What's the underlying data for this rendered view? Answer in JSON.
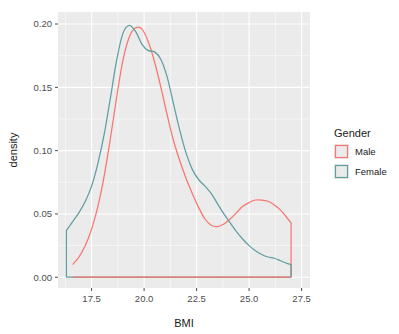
{
  "chart_data": {
    "type": "line",
    "title": "",
    "subtitle": "",
    "xlabel": "BMI",
    "ylabel": "density",
    "xlim": [
      15.9,
      27.9
    ],
    "ylim": [
      -0.0085,
      0.2095
    ],
    "x_ticks": [
      "17.5",
      "20.0",
      "22.5",
      "25.0",
      "27.5"
    ],
    "x_tick_values": [
      17.5,
      20.0,
      22.5,
      25.0,
      27.5
    ],
    "y_ticks": [
      "0.00",
      "0.05",
      "0.10",
      "0.15",
      "0.20"
    ],
    "y_tick_values": [
      0.0,
      0.05,
      0.1,
      0.15,
      0.2
    ],
    "grid": true,
    "grid_minor": true,
    "legend_position": "right",
    "legend_title": "Gender",
    "panel_background": "#ebebeb",
    "grid_color": "#ffffff",
    "series": [
      {
        "name": "Male",
        "color": "#f8766d",
        "x": [
          16.6,
          16.9,
          17.2,
          17.5,
          17.8,
          18.1,
          18.4,
          18.7,
          19.0,
          19.3,
          19.6,
          19.9,
          20.2,
          20.5,
          20.8,
          21.1,
          21.4,
          21.7,
          22.0,
          22.3,
          22.6,
          22.9,
          23.2,
          23.5,
          23.8,
          24.1,
          24.4,
          24.7,
          25.0,
          25.3,
          25.6,
          25.9,
          26.2,
          26.5,
          26.8,
          27.0,
          27.0
        ],
        "y": [
          0.01,
          0.016,
          0.025,
          0.038,
          0.056,
          0.08,
          0.11,
          0.143,
          0.172,
          0.19,
          0.197,
          0.196,
          0.186,
          0.17,
          0.15,
          0.128,
          0.108,
          0.092,
          0.078,
          0.066,
          0.055,
          0.046,
          0.041,
          0.04,
          0.042,
          0.046,
          0.051,
          0.056,
          0.059,
          0.061,
          0.061,
          0.06,
          0.057,
          0.053,
          0.047,
          0.043,
          0.0
        ]
      },
      {
        "name": "Female",
        "color": "#5f9ea0",
        "x": [
          16.3,
          16.3,
          16.6,
          16.9,
          17.2,
          17.5,
          17.8,
          18.1,
          18.4,
          18.7,
          19.0,
          19.3,
          19.6,
          19.9,
          20.2,
          20.5,
          20.8,
          21.1,
          21.4,
          21.7,
          22.0,
          22.3,
          22.6,
          22.9,
          23.2,
          23.5,
          23.8,
          24.1,
          24.4,
          24.7,
          25.0,
          25.3,
          25.6,
          25.9,
          26.2,
          26.5,
          26.8,
          27.0,
          27.0
        ],
        "y": [
          0.0,
          0.037,
          0.044,
          0.051,
          0.06,
          0.072,
          0.09,
          0.113,
          0.142,
          0.172,
          0.193,
          0.199,
          0.194,
          0.184,
          0.179,
          0.178,
          0.172,
          0.158,
          0.137,
          0.116,
          0.098,
          0.085,
          0.077,
          0.072,
          0.066,
          0.058,
          0.05,
          0.043,
          0.036,
          0.03,
          0.025,
          0.021,
          0.018,
          0.016,
          0.015,
          0.013,
          0.011,
          0.01,
          0.0
        ]
      }
    ],
    "baseline_segments": [
      {
        "series": "Female",
        "x_from": 16.3,
        "x_to": 27.0,
        "y": 0.0
      },
      {
        "series": "Male",
        "x_from": 16.6,
        "x_to": 27.0,
        "y": 0.0
      }
    ]
  },
  "axes": {
    "x_title": "BMI",
    "y_title": "density",
    "x_tick_labels": [
      "17.5",
      "20.0",
      "22.5",
      "25.0",
      "27.5"
    ],
    "y_tick_labels": [
      "0.00",
      "0.05",
      "0.10",
      "0.15",
      "0.20"
    ]
  },
  "legend": {
    "title": "Gender",
    "items": [
      {
        "label": "Male",
        "color": "#f8766d"
      },
      {
        "label": "Female",
        "color": "#5f9ea0"
      }
    ]
  }
}
